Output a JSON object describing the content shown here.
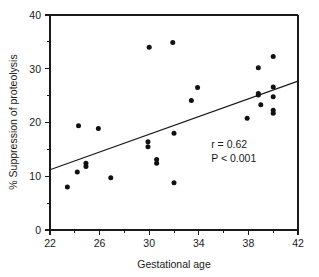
{
  "chart_data": {
    "type": "scatter",
    "title": "",
    "xlabel": "Gestational age",
    "ylabel": "% Suppression of proteolysis",
    "xlim": [
      22,
      42
    ],
    "ylim": [
      0,
      40
    ],
    "grid": false,
    "legend": null,
    "x_ticks_major": [
      22,
      26,
      30,
      34,
      38,
      42
    ],
    "x_ticks_minor": [
      24,
      28,
      32,
      36,
      40
    ],
    "y_ticks_major": [
      0,
      10,
      20,
      30,
      40
    ],
    "y_ticks_minor": [
      5,
      15,
      25,
      35
    ],
    "x_tick_labels": [
      "22",
      "26",
      "30",
      "34",
      "38",
      "42"
    ],
    "y_tick_labels": [
      "0",
      "10",
      "20",
      "30",
      "40"
    ],
    "points": [
      {
        "x": 23.4,
        "y": 8.0
      },
      {
        "x": 24.2,
        "y": 10.8
      },
      {
        "x": 24.3,
        "y": 19.4
      },
      {
        "x": 24.9,
        "y": 12.4
      },
      {
        "x": 24.9,
        "y": 11.8
      },
      {
        "x": 25.9,
        "y": 18.9
      },
      {
        "x": 26.9,
        "y": 9.7
      },
      {
        "x": 29.9,
        "y": 16.4
      },
      {
        "x": 29.9,
        "y": 15.5
      },
      {
        "x": 30.0,
        "y": 34.0
      },
      {
        "x": 30.6,
        "y": 13.1
      },
      {
        "x": 30.6,
        "y": 12.4
      },
      {
        "x": 31.9,
        "y": 34.9
      },
      {
        "x": 32.0,
        "y": 18.0
      },
      {
        "x": 32.0,
        "y": 8.8
      },
      {
        "x": 33.4,
        "y": 24.1
      },
      {
        "x": 33.9,
        "y": 26.5
      },
      {
        "x": 37.9,
        "y": 20.8
      },
      {
        "x": 38.8,
        "y": 30.2
      },
      {
        "x": 38.8,
        "y": 25.4
      },
      {
        "x": 38.8,
        "y": 25.1
      },
      {
        "x": 39.0,
        "y": 23.3
      },
      {
        "x": 40.0,
        "y": 32.3
      },
      {
        "x": 40.0,
        "y": 26.6
      },
      {
        "x": 40.0,
        "y": 24.8
      },
      {
        "x": 40.0,
        "y": 22.3
      },
      {
        "x": 40.0,
        "y": 21.7
      }
    ],
    "regression_line": {
      "x_start": 22,
      "y_start": 11.2,
      "x_end": 42,
      "y_end": 27.7
    },
    "annotations": [
      {
        "text": "r = 0.62",
        "x": 35.0,
        "y": 15.2
      },
      {
        "text": "P < 0.001",
        "x": 35.0,
        "y": 12.6
      }
    ]
  },
  "colors": {
    "axis": "#1a1a1a",
    "point": "#111111",
    "line": "#1a1a1a",
    "background": "#ffffff"
  }
}
